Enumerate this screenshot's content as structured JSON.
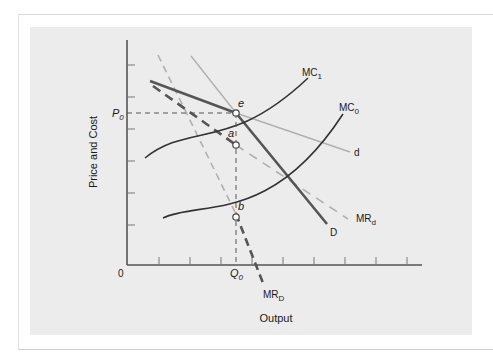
{
  "diagram": {
    "type": "economics-kinked-demand",
    "y_axis_label": "Price and Cost",
    "x_axis_label": "Output",
    "origin_label": "0",
    "price_label": {
      "main": "P",
      "sub": "0"
    },
    "quantity_label": {
      "main": "Q",
      "sub": "0"
    },
    "curves": {
      "mc1": {
        "main": "MC",
        "sub": "1"
      },
      "mc0": {
        "main": "MC",
        "sub": "0"
      },
      "d_small": {
        "main": "d",
        "sub": ""
      },
      "d_big": {
        "main": "D",
        "sub": ""
      },
      "mr_small": {
        "main": "MR",
        "sub": "d"
      },
      "mr_big": {
        "main": "MR",
        "sub": "D"
      }
    },
    "points": {
      "e": "e",
      "a": "a",
      "b": "b"
    },
    "colors": {
      "panel_bg": "#ececec",
      "dark_curve": "#555555",
      "light_curve": "#b0b0b0",
      "axis": "#555555"
    }
  }
}
